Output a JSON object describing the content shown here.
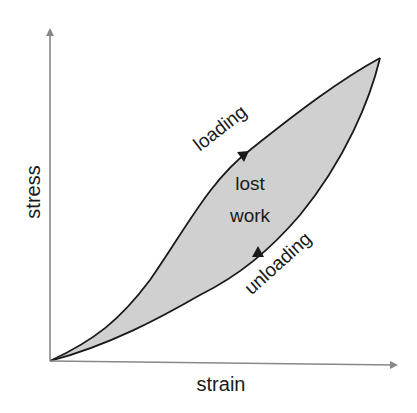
{
  "diagram": {
    "axes": {
      "x_label": "strain",
      "y_label": "stress"
    },
    "curves": {
      "loading_label": "loading",
      "unloading_label": "unloading"
    },
    "region": {
      "line1": "lost",
      "line2": "work"
    },
    "colors": {
      "axis": "#888888",
      "curve": "#1a1a1a",
      "fill": "#d0d0d0",
      "text": "#1a1a1a"
    }
  }
}
